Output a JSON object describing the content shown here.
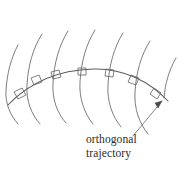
{
  "figure": {
    "background_color": "#ffffff",
    "width": 187,
    "height": 173,
    "caption": {
      "line1": "orthogonal",
      "line2": "trajectory"
    },
    "colors": {
      "family_curve_stroke": "#6e6e6e",
      "trajectory_stroke": "#5a5a5a",
      "right_angle_stroke": "#6a6a6a",
      "leader_stroke": "#7a7a7a",
      "arrowhead_fill": "#4a4a4a",
      "caption_color": "#2b2b2b"
    },
    "family_curves": [
      {
        "name": "family-curve-1",
        "path": "M 18,45 C 11,58 7,74 6,90 C 5,103 10,115 18,124"
      },
      {
        "name": "family-curve-2",
        "path": "M 42,34 C 33,48 28,66 27,85 C 26,100 31,114 40,124"
      },
      {
        "name": "family-curve-3",
        "path": "M 68,31 C 59,45 54,64 53,83 C 52,99 57,113 66,123"
      },
      {
        "name": "family-curve-4",
        "path": "M 95,30 C 86,44 81,63 80,82 C 79,98 84,113 93,124"
      },
      {
        "name": "family-curve-5",
        "path": "M 123,33 C 114,47 109,66 108,85 C 107,101 112,116 121,127"
      },
      {
        "name": "family-curve-6",
        "path": "M 150,41 C 141,55 136,73 135,92 C 134,108 139,123 148,134"
      },
      {
        "name": "family-curve-7",
        "path": "M 176,58 C 169,70 165,84 164,98"
      }
    ],
    "trajectory": {
      "name": "orthogonal-trajectory",
      "path": "M 8,105 C 30,82 58,70 93,69 C 124,68 150,82 168,101"
    },
    "right_angle_marks": [
      {
        "name": "right-angle-mark-1",
        "path": "M 14,92 L 22,88 L 26,95 L 18,99 Z"
      },
      {
        "name": "right-angle-mark-2",
        "path": "M 31,78 L 39,75 L 42,82 L 34,85 Z"
      },
      {
        "name": "right-angle-mark-3",
        "path": "M 51,72 L 59,70 L 61,77 L 53,79 Z"
      },
      {
        "name": "right-angle-mark-4",
        "path": "M 78,68 L 86,68 L 86,75 L 78,75 Z"
      },
      {
        "name": "right-angle-mark-5",
        "path": "M 106,69 L 114,70 L 113,77 L 105,76 Z"
      },
      {
        "name": "right-angle-mark-6",
        "path": "M 131,75 L 139,78 L 136,85 L 128,82 Z"
      },
      {
        "name": "right-angle-mark-7",
        "path": "M 154,88 L 161,93 L 157,99 L 150,94 Z"
      }
    ],
    "leader": {
      "name": "caption-leader-line",
      "path": "M 133,136 L 162,101",
      "arrowhead_path": "M 162,101 L 155,103 L 158,108 Z"
    }
  }
}
